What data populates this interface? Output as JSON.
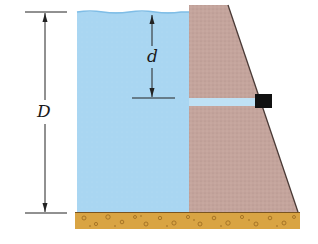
{
  "figure": {
    "labels": {
      "total_depth": "D",
      "pipe_depth": "d"
    }
  },
  "colors": {
    "water": "#a9d6f2",
    "water_surface": "#7fbde6",
    "dam": "#c4a49c",
    "dam_edge": "#4a3a36",
    "ground": "#d9a443",
    "ground_pebble": "#9a6a20",
    "valve": "#111111",
    "pipe_water": "#bfe1f5",
    "dimension_line": "#222222"
  },
  "components": [
    {
      "name": "water-reservoir",
      "description": "Water held behind dam"
    },
    {
      "name": "dam",
      "description": "Trapezoidal concrete dam"
    },
    {
      "name": "outlet-pipe",
      "description": "Horizontal pipe through dam at depth d"
    },
    {
      "name": "valve",
      "description": "Black valve at outlet of pipe"
    },
    {
      "name": "ground",
      "description": "Gravel foundation"
    }
  ]
}
